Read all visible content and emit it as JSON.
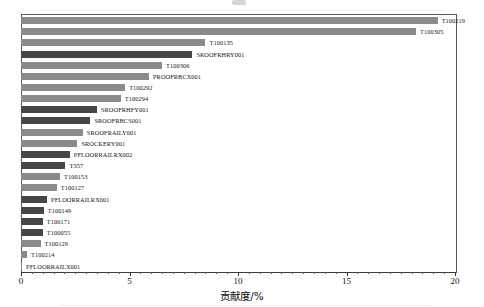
{
  "figure": {
    "axis_label_x": "贡献度/%",
    "axis_color": "#3c3c3c",
    "bar_color_light": "#8a8a8a",
    "bar_color_dark": "#464646"
  },
  "axis": {
    "ticks": [
      {
        "value": 0,
        "label": "0"
      },
      {
        "value": 5,
        "label": "5"
      },
      {
        "value": 10,
        "label": "10"
      },
      {
        "value": 15,
        "label": "15"
      },
      {
        "value": 20,
        "label": "20"
      }
    ]
  },
  "chart_data": {
    "type": "bar",
    "orientation": "horizontal",
    "title": "",
    "xlabel": "贡献度/%",
    "ylabel": "",
    "xlim": [
      0,
      20
    ],
    "grid": false,
    "legend": false,
    "categories": [
      "T100219",
      "T100305",
      "T100135",
      "SROOFRHRY001",
      "T100306",
      "PROOFRBCX001",
      "T100292",
      "T100294",
      "SROOFRHFY001",
      "SROOFRBCS001",
      "SROOFRAILY001",
      "SROCKERY001",
      "PFLOORRAILRX002",
      "T357",
      "T100153",
      "T100127",
      "PFLOORRAILRX001",
      "T100149",
      "T100171",
      "T100055",
      "T100129",
      "T100214",
      "PFLOORRAILX001"
    ],
    "values": [
      19.2,
      18.2,
      8.5,
      7.9,
      6.5,
      5.9,
      4.8,
      4.6,
      3.5,
      3.2,
      2.85,
      2.6,
      2.25,
      2.05,
      1.8,
      1.65,
      1.2,
      1.05,
      1.0,
      1.0,
      0.9,
      0.28,
      0.05
    ],
    "shades": [
      "light",
      "light",
      "light",
      "dark",
      "light",
      "light",
      "light",
      "light",
      "dark",
      "dark",
      "light",
      "light",
      "dark",
      "dark",
      "light",
      "light",
      "dark",
      "dark",
      "dark",
      "dark",
      "light",
      "light",
      "light"
    ]
  }
}
